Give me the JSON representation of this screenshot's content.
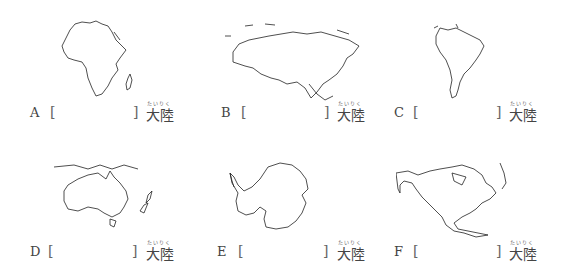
{
  "worksheet": {
    "suffix": "大陸",
    "suffix_ruby": "たいりく",
    "open_bracket": "[",
    "close_bracket": "]",
    "items": [
      {
        "letter": "A",
        "continent_shape": "africa-outline-map",
        "answer": ""
      },
      {
        "letter": "B",
        "continent_shape": "eurasia-outline-map",
        "answer": ""
      },
      {
        "letter": "C",
        "continent_shape": "south-america-outline-map",
        "answer": ""
      },
      {
        "letter": "D",
        "continent_shape": "australia-outline-map",
        "answer": ""
      },
      {
        "letter": "E",
        "continent_shape": "antarctica-outline-map",
        "answer": ""
      },
      {
        "letter": "F",
        "continent_shape": "north-america-outline-map",
        "answer": ""
      }
    ]
  }
}
